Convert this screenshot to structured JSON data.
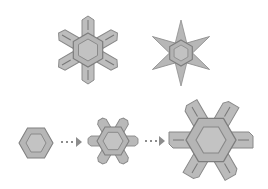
{
  "diagram": {
    "title": "Ice crystal forms and growth sequence",
    "colors": {
      "background": "#ffffff",
      "fill": "#b9b9b9",
      "fill_inner": "#c4c4c4",
      "stroke": "#8a8a8a",
      "stroke_dark": "#7a7a7a",
      "arrow": "#8c8c8c"
    },
    "top_row": [
      {
        "id": "branched-plate",
        "label": "Branched plate crystal",
        "cx": 88,
        "cy": 50,
        "radius": 30
      },
      {
        "id": "stellar",
        "label": "Stellar crystal",
        "cx": 181,
        "cy": 53,
        "radius": 33
      }
    ],
    "bottom_row": [
      {
        "id": "hexagonal-plate",
        "label": "Hexagonal plate (stage 1)",
        "cx": 36,
        "cy": 143,
        "radius": 17
      },
      {
        "id": "small-branched",
        "label": "Small branched plate (stage 2)",
        "cx": 113,
        "cy": 141,
        "radius": 25
      },
      {
        "id": "large-branched",
        "label": "Large branched plate (stage 3)",
        "cx": 211,
        "cy": 140,
        "radius": 40
      }
    ],
    "arrows": [
      {
        "id": "arrow-1",
        "x1": 61,
        "x2": 81,
        "y": 142
      },
      {
        "id": "arrow-2",
        "x1": 145,
        "x2": 164,
        "y": 141
      }
    ]
  }
}
